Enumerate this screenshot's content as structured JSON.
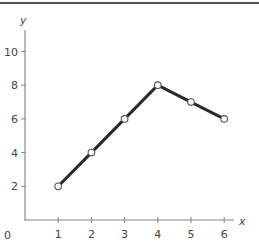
{
  "chart_data": {
    "type": "line",
    "title": "",
    "xlabel": "x",
    "ylabel": "y",
    "x": [
      1,
      2,
      3,
      4,
      5,
      6
    ],
    "series": [
      {
        "name": "y",
        "values": [
          2,
          4,
          6,
          8,
          7,
          6
        ]
      }
    ],
    "xticks": [
      "1",
      "2",
      "3",
      "4",
      "5",
      "6"
    ],
    "yticks": [
      "2",
      "4",
      "6",
      "8",
      "10"
    ],
    "origin_label": "0",
    "xlim": [
      0,
      6.3
    ],
    "ylim": [
      0,
      11.5
    ],
    "grid": false,
    "legend": "none",
    "marker": "open-circle",
    "line_color": "#2a2a2a",
    "axis_color": "#888888"
  }
}
